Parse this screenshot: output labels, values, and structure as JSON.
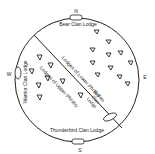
{
  "diagram": {
    "compass": {
      "north": "N",
      "south": "S",
      "east": "E",
      "west": "W"
    },
    "lodges": {
      "bear": "Bear Clan Lodge",
      "thunderbird": "Thunderbird Clan Lodge",
      "warrior": "Warrior Clan Lodge",
      "buffalo_line1": "Buffalo",
      "buffalo_line2": "Clan",
      "buffalo_line3": "Lodge",
      "lower_phratry": "Lodges of Lower Phratry",
      "upper_phratry": "Lodges of Upper Phratry"
    },
    "tent_icon": "triangle-tent-icon",
    "colors": {
      "line": "#222222",
      "background": "#ffffff"
    }
  }
}
